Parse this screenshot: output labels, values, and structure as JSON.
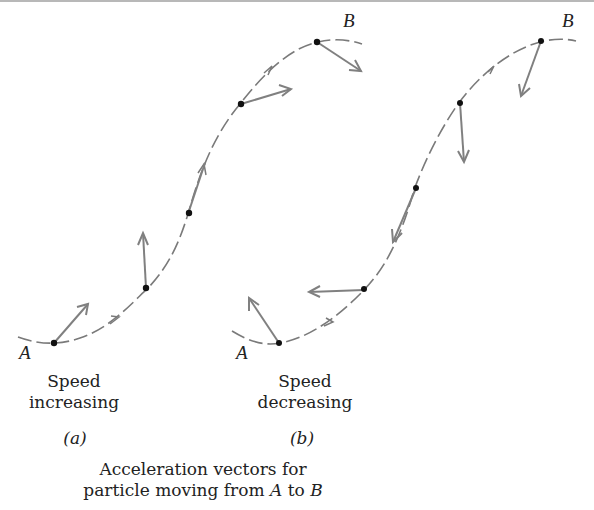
{
  "figure": {
    "panel_a": {
      "start_label": "A",
      "end_label": "B",
      "caption_line1": "Speed",
      "caption_line2": "increasing",
      "tag": "(a)"
    },
    "panel_b": {
      "start_label": "A",
      "end_label": "B",
      "caption_line1": "Speed",
      "caption_line2": "decreasing",
      "tag": "(b)"
    },
    "caption_line1": "Acceleration vectors for",
    "caption_line2_prefix": "particle moving from ",
    "caption_line2_A": "A",
    "caption_line2_mid": " to ",
    "caption_line2_B": "B",
    "colors": {
      "path": "#7a7a7a",
      "vector": "#808080",
      "point": "#111111",
      "text": "#222222"
    }
  }
}
